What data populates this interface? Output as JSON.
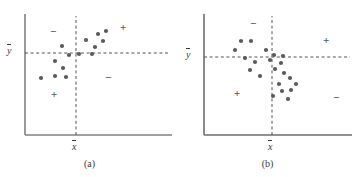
{
  "figure": {
    "panels": [
      {
        "id": "a",
        "caption": "(a)",
        "x_axis_label": "x",
        "y_axis_label": "y",
        "axis_color": "#808080",
        "dash_color": "#555555",
        "point_color": "#5a5a5a",
        "origin": {
          "x": 25,
          "y": 135
        },
        "axis_end": {
          "x": 172,
          "y": 14
        },
        "xbar": 76,
        "ybar": 53,
        "quadrant_signs": [
          {
            "label": "−",
            "quadrant": "upper-left",
            "x": 50,
            "y": 26
          },
          {
            "label": "+",
            "quadrant": "upper-right",
            "x": 120,
            "y": 22
          },
          {
            "label": "−",
            "quadrant": "lower-right",
            "x": 105,
            "y": 72
          },
          {
            "label": "+",
            "quadrant": "lower-left",
            "x": 51,
            "y": 89
          }
        ],
        "points": [
          {
            "x": 62,
            "y": 46
          },
          {
            "x": 55,
            "y": 61
          },
          {
            "x": 63,
            "y": 68
          },
          {
            "x": 69,
            "y": 55
          },
          {
            "x": 41,
            "y": 78
          },
          {
            "x": 55,
            "y": 76
          },
          {
            "x": 66,
            "y": 77
          },
          {
            "x": 79,
            "y": 54
          },
          {
            "x": 86,
            "y": 40
          },
          {
            "x": 92,
            "y": 54
          },
          {
            "x": 95,
            "y": 47
          },
          {
            "x": 98,
            "y": 34
          },
          {
            "x": 103,
            "y": 41
          },
          {
            "x": 106,
            "y": 31
          }
        ]
      },
      {
        "id": "b",
        "caption": "(b)",
        "x_axis_label": "x",
        "y_axis_label": "y",
        "axis_color": "#6e6e6e",
        "dash_color": "#555555",
        "point_color": "#5a5a5a",
        "origin": {
          "x": 26,
          "y": 135
        },
        "axis_end": {
          "x": 174,
          "y": 14
        },
        "xbar": 94,
        "ybar": 57,
        "quadrant_signs": [
          {
            "label": "−",
            "quadrant": "upper-left",
            "x": 72,
            "y": 18
          },
          {
            "label": "+",
            "quadrant": "upper-right",
            "x": 145,
            "y": 35
          },
          {
            "label": "+",
            "quadrant": "lower-left",
            "x": 56,
            "y": 88
          },
          {
            "label": "−",
            "quadrant": "lower-right",
            "x": 155,
            "y": 92
          }
        ],
        "points": [
          {
            "x": 63,
            "y": 41
          },
          {
            "x": 73,
            "y": 41
          },
          {
            "x": 57,
            "y": 50
          },
          {
            "x": 67,
            "y": 58
          },
          {
            "x": 77,
            "y": 62
          },
          {
            "x": 88,
            "y": 50
          },
          {
            "x": 92,
            "y": 60
          },
          {
            "x": 96,
            "y": 55
          },
          {
            "x": 105,
            "y": 56
          },
          {
            "x": 72,
            "y": 70
          },
          {
            "x": 82,
            "y": 76
          },
          {
            "x": 97,
            "y": 69
          },
          {
            "x": 103,
            "y": 63
          },
          {
            "x": 106,
            "y": 73
          },
          {
            "x": 112,
            "y": 78
          },
          {
            "x": 118,
            "y": 84
          },
          {
            "x": 101,
            "y": 84
          },
          {
            "x": 104,
            "y": 91
          },
          {
            "x": 113,
            "y": 90
          },
          {
            "x": 95,
            "y": 96
          },
          {
            "x": 110,
            "y": 99
          }
        ]
      }
    ]
  },
  "chart_data": {
    "type": "scatter",
    "title": "",
    "xlabel": "x",
    "ylabel": "y",
    "grid": false,
    "legend": null,
    "panels": [
      {
        "name": "(a)",
        "description": "Positive linear association; most points lie in the (+,+) upper-right and (−,−) lower-left quadrants relative to the means.",
        "reference_lines": {
          "xbar": "x̄",
          "ybar": "ȳ"
        },
        "quadrant_sign_labels": [
          "−",
          "+",
          "−",
          "+"
        ],
        "n_points": 14,
        "points_plot_units": [
          [
            0.35,
            0.66
          ],
          [
            0.21,
            0.55
          ],
          [
            0.34,
            0.49
          ],
          [
            0.46,
            0.59
          ],
          [
            0.11,
            0.42
          ],
          [
            0.21,
            0.44
          ],
          [
            0.43,
            0.43
          ],
          [
            0.52,
            0.6
          ],
          [
            0.62,
            0.71
          ],
          [
            0.7,
            0.6
          ],
          [
            0.73,
            0.66
          ],
          [
            0.76,
            0.76
          ],
          [
            0.81,
            0.7
          ],
          [
            0.84,
            0.78
          ]
        ]
      },
      {
        "name": "(b)",
        "description": "No clear linear association; points are scattered across all four quadrants relative to the means.",
        "reference_lines": {
          "xbar": "x̄",
          "ybar": "ȳ"
        },
        "quadrant_sign_labels": [
          "−",
          "+",
          "+",
          "−"
        ],
        "n_points": 21,
        "points_plot_units": [
          [
            0.25,
            0.72
          ],
          [
            0.32,
            0.72
          ],
          [
            0.21,
            0.65
          ],
          [
            0.28,
            0.59
          ],
          [
            0.35,
            0.56
          ],
          [
            0.42,
            0.65
          ],
          [
            0.45,
            0.57
          ],
          [
            0.48,
            0.61
          ],
          [
            0.53,
            0.6
          ],
          [
            0.31,
            0.5
          ],
          [
            0.38,
            0.45
          ],
          [
            0.48,
            0.49
          ],
          [
            0.52,
            0.54
          ],
          [
            0.54,
            0.46
          ],
          [
            0.58,
            0.42
          ],
          [
            0.62,
            0.37
          ],
          [
            0.51,
            0.37
          ],
          [
            0.53,
            0.31
          ],
          [
            0.59,
            0.32
          ],
          [
            0.47,
            0.27
          ],
          [
            0.57,
            0.24
          ]
        ]
      }
    ]
  }
}
